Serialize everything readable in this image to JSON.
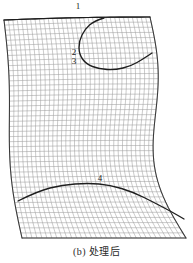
{
  "figure": {
    "caption": "(b) 处理后",
    "labels": {
      "one": "1",
      "two": "2",
      "three": "3",
      "four": "4"
    },
    "colors": {
      "background": "#ffffff",
      "grid_line": "#8a8a8a",
      "boundary_line": "#3a3a3a",
      "feature_curve": "#1e1e1e",
      "label_text": "#1a1a1a"
    }
  },
  "chart_data": {
    "type": "line",
    "title": "(b) 处理后",
    "subtitle": "",
    "xlabel": "",
    "ylabel": "",
    "grid": true,
    "legend_position": "none",
    "xlim": [
      0,
      193
    ],
    "ylim": [
      0,
      240
    ],
    "mesh": {
      "n_i": 34,
      "n_j": 44,
      "top_edge": [
        [
          4,
          20
        ],
        [
          40,
          19
        ],
        [
          80,
          18
        ],
        [
          118,
          17
        ],
        [
          150,
          17
        ]
      ],
      "bottom_edge": [
        [
          22,
          238
        ],
        [
          70,
          238
        ],
        [
          120,
          238
        ],
        [
          165,
          238
        ],
        [
          186,
          238
        ]
      ],
      "left_edge": [
        [
          4,
          20
        ],
        [
          8,
          60
        ],
        [
          14,
          110
        ],
        [
          18,
          160
        ],
        [
          22,
          238
        ]
      ],
      "right_edge": [
        [
          150,
          17
        ],
        [
          152,
          55
        ],
        [
          168,
          110
        ],
        [
          182,
          165
        ],
        [
          186,
          238
        ]
      ]
    },
    "annotations": [
      {
        "label": "1",
        "name": "top-boundary-curve",
        "x": 78,
        "y": 6,
        "curve": [
          [
            4,
            20
          ],
          [
            50,
            19
          ],
          [
            104,
            18
          ],
          [
            150,
            17
          ]
        ]
      },
      {
        "label": "2",
        "name": "hook-curve-upper",
        "x": 74,
        "y": 52,
        "curve": [
          [
            104,
            18
          ],
          [
            84,
            26
          ],
          [
            76,
            44
          ],
          [
            82,
            62
          ],
          [
            100,
            70
          ]
        ]
      },
      {
        "label": "3",
        "name": "hook-curve-lower",
        "x": 74,
        "y": 61,
        "curve": [
          [
            100,
            70
          ],
          [
            124,
            70
          ],
          [
            142,
            62
          ],
          [
            152,
            55
          ]
        ]
      },
      {
        "label": "4",
        "name": "lower-feature-curve",
        "x": 100,
        "y": 178,
        "curve": [
          [
            18,
            200
          ],
          [
            60,
            186
          ],
          [
            104,
            183
          ],
          [
            148,
            199
          ],
          [
            182,
            218
          ]
        ]
      }
    ],
    "series": [
      {
        "name": "top-boundary",
        "x": [
          4,
          50,
          104,
          150
        ],
        "y": [
          20,
          19,
          18,
          17
        ]
      },
      {
        "name": "hook-curve",
        "x": [
          104,
          84,
          76,
          82,
          100,
          124,
          142,
          152
        ],
        "y": [
          18,
          26,
          44,
          62,
          70,
          70,
          62,
          55
        ]
      },
      {
        "name": "lower-curve",
        "x": [
          18,
          60,
          104,
          148,
          182
        ],
        "y": [
          200,
          186,
          183,
          199,
          218
        ]
      }
    ]
  }
}
